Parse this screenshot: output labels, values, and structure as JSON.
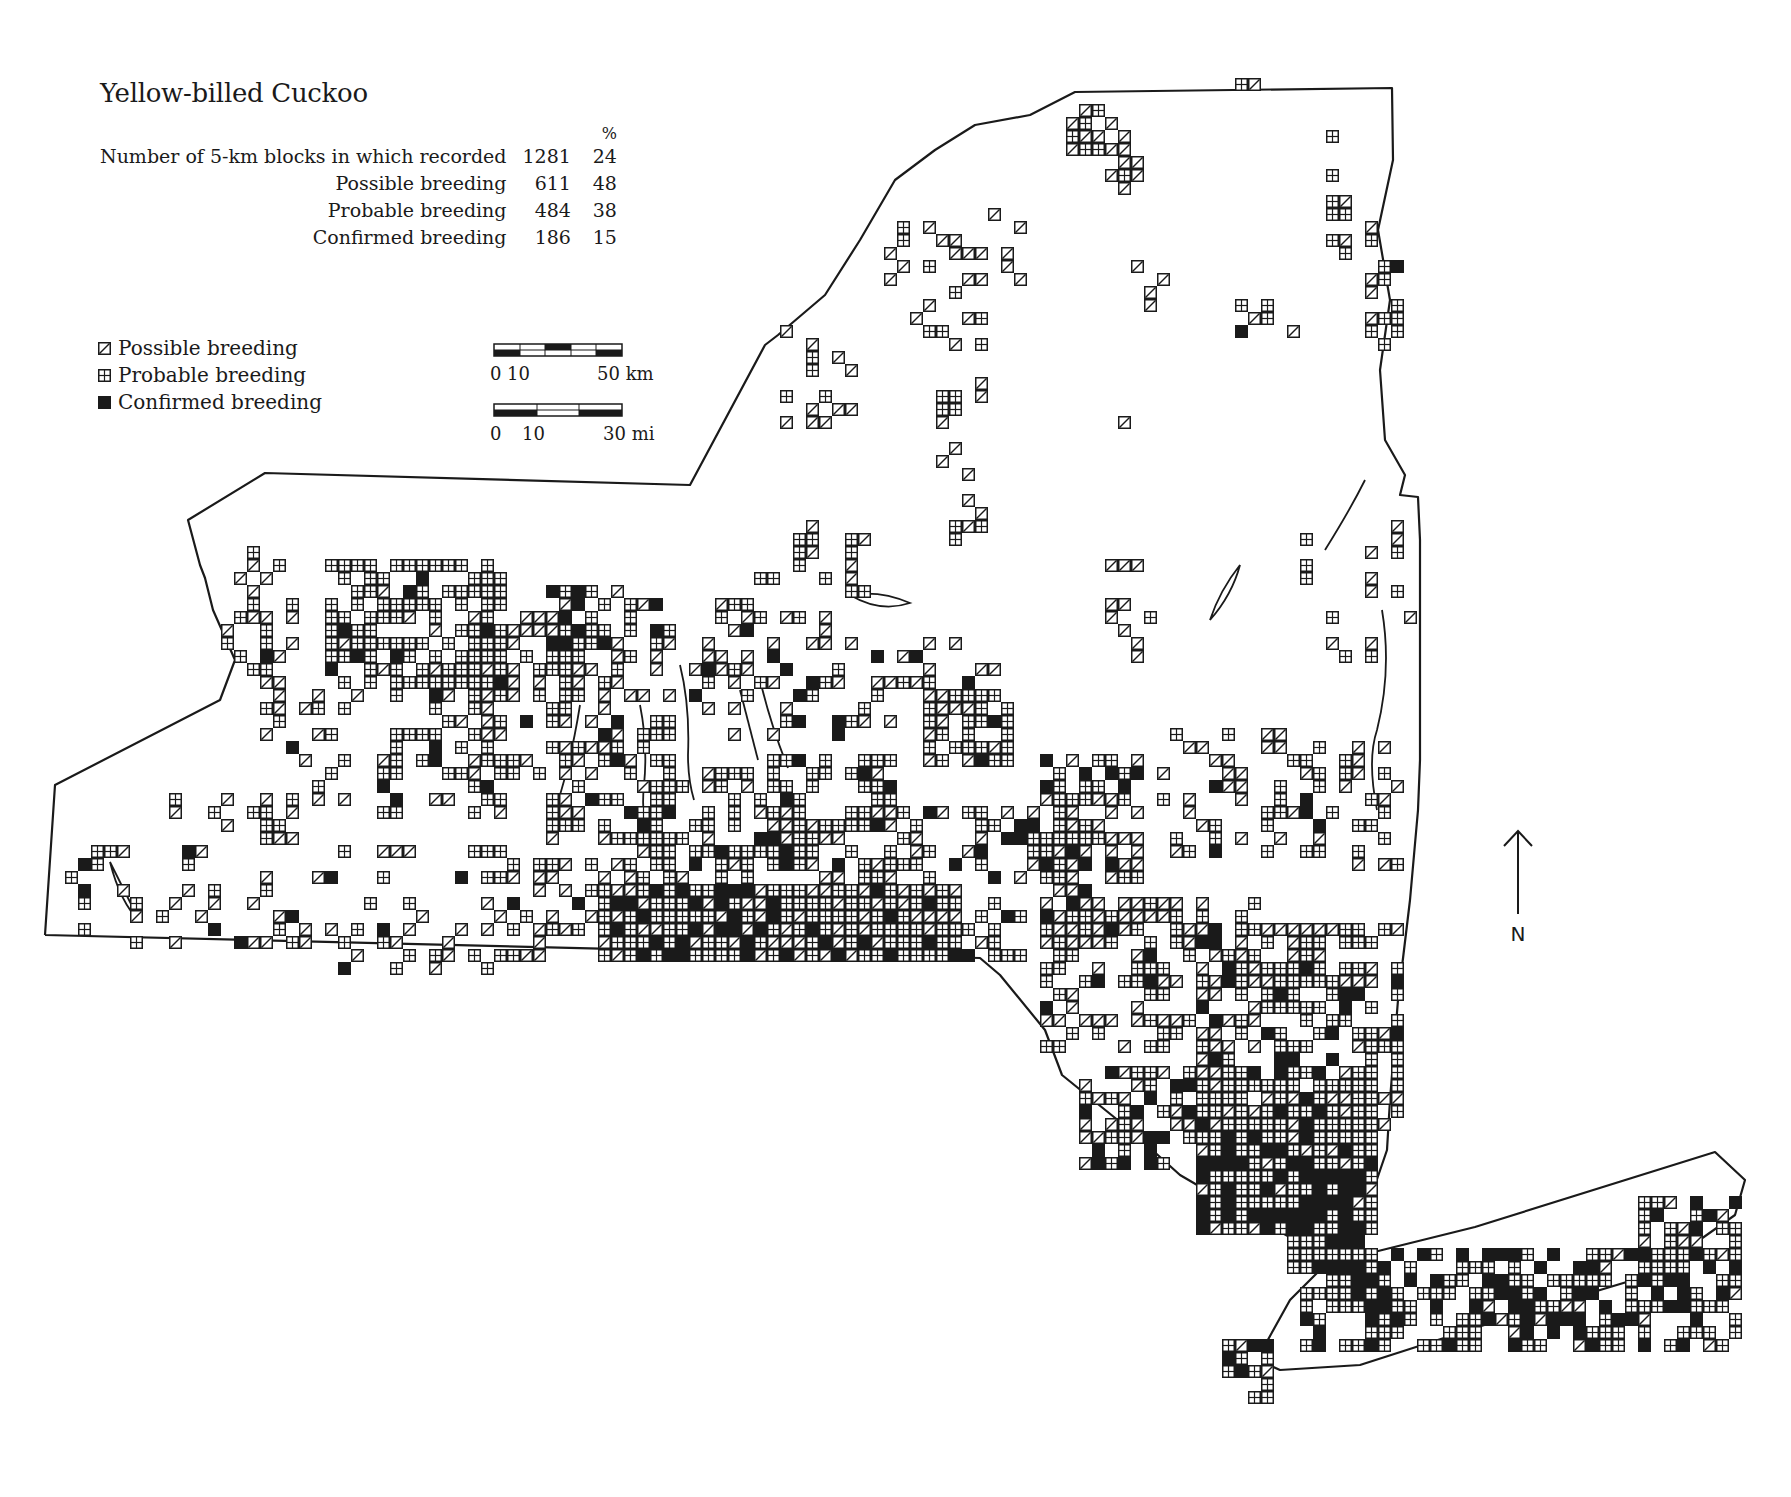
{
  "title": "Yellow-billed Cuckoo",
  "stats": {
    "pct_header": "%",
    "rows": [
      {
        "label": "Number of 5-km blocks in which recorded",
        "count": "1281",
        "pct": "24"
      },
      {
        "label": "Possible breeding",
        "count": "611",
        "pct": "48"
      },
      {
        "label": "Probable breeding",
        "count": "484",
        "pct": "38"
      },
      {
        "label": "Confirmed breeding",
        "count": "186",
        "pct": "15"
      }
    ]
  },
  "legend": {
    "items": [
      {
        "symbol": "possible-icon",
        "label": "Possible breeding"
      },
      {
        "symbol": "probable-icon",
        "label": "Probable breeding"
      },
      {
        "symbol": "confirmed-icon",
        "label": "Confirmed breeding"
      }
    ]
  },
  "scale": {
    "km": {
      "start": "0",
      "mid": "10",
      "end": "50 km"
    },
    "mi": {
      "start": "0",
      "mid": "10",
      "end": "30 mi"
    }
  },
  "north_label": "N",
  "colors": {
    "ink": "#1a1a1a",
    "paper": "#ffffff"
  },
  "map": {
    "block_size": 13,
    "outline": [
      [
        45,
        935
      ],
      [
        55,
        785
      ],
      [
        220,
        700
      ],
      [
        235,
        660
      ],
      [
        213,
        610
      ],
      [
        205,
        578
      ],
      [
        200,
        565
      ],
      [
        188,
        520
      ],
      [
        265,
        473
      ],
      [
        690,
        485
      ],
      [
        765,
        345
      ],
      [
        778,
        335
      ],
      [
        825,
        295
      ],
      [
        860,
        240
      ],
      [
        895,
        180
      ],
      [
        935,
        150
      ],
      [
        975,
        125
      ],
      [
        1030,
        115
      ],
      [
        1075,
        92
      ],
      [
        1392,
        88
      ],
      [
        1393,
        160
      ],
      [
        1378,
        230
      ],
      [
        1390,
        300
      ],
      [
        1380,
        370
      ],
      [
        1385,
        440
      ],
      [
        1405,
        475
      ],
      [
        1400,
        495
      ],
      [
        1418,
        497
      ],
      [
        1420,
        540
      ],
      [
        1420,
        760
      ],
      [
        1418,
        810
      ],
      [
        1410,
        900
      ],
      [
        1398,
        1000
      ],
      [
        1390,
        1100
      ],
      [
        1387,
        1150
      ],
      [
        1350,
        1258
      ],
      [
        1475,
        1227
      ],
      [
        1715,
        1152
      ],
      [
        1745,
        1180
      ],
      [
        1735,
        1215
      ],
      [
        1650,
        1275
      ],
      [
        1500,
        1320
      ],
      [
        1360,
        1365
      ],
      [
        1280,
        1370
      ],
      [
        1262,
        1362
      ],
      [
        1265,
        1345
      ],
      [
        1290,
        1300
      ],
      [
        1340,
        1250
      ],
      [
        1295,
        1240
      ],
      [
        1240,
        1210
      ],
      [
        1180,
        1175
      ],
      [
        1130,
        1130
      ],
      [
        1062,
        1075
      ],
      [
        1045,
        1030
      ],
      [
        1000,
        975
      ],
      [
        980,
        958
      ],
      [
        45,
        935
      ]
    ],
    "clusters": [
      {
        "x": 1070,
        "y": 100,
        "w": 5,
        "h": 4,
        "n": 14,
        "p": 0.62,
        "c": 0.0
      },
      {
        "x": 1100,
        "y": 140,
        "w": 3,
        "h": 4,
        "n": 6,
        "p": 0.85,
        "c": 0.0
      },
      {
        "x": 1230,
        "y": 82,
        "w": 2,
        "h": 1,
        "n": 2,
        "p": 0.8,
        "c": 0.0
      },
      {
        "x": 1320,
        "y": 125,
        "w": 2,
        "h": 10,
        "n": 9,
        "p": 0.3,
        "c": 0.0
      },
      {
        "x": 1360,
        "y": 220,
        "w": 3,
        "h": 10,
        "n": 14,
        "p": 0.4,
        "c": 0.05
      },
      {
        "x": 1240,
        "y": 290,
        "w": 5,
        "h": 4,
        "n": 6,
        "p": 0.6,
        "c": 0.3
      },
      {
        "x": 880,
        "y": 220,
        "w": 8,
        "h": 10,
        "n": 22,
        "p": 0.72,
        "c": 0.0
      },
      {
        "x": 980,
        "y": 210,
        "w": 5,
        "h": 6,
        "n": 6,
        "p": 0.9,
        "c": 0.0
      },
      {
        "x": 1130,
        "y": 260,
        "w": 3,
        "h": 4,
        "n": 4,
        "p": 1.0,
        "c": 0.0
      },
      {
        "x": 780,
        "y": 330,
        "w": 6,
        "h": 8,
        "n": 14,
        "p": 0.65,
        "c": 0.0
      },
      {
        "x": 930,
        "y": 380,
        "w": 4,
        "h": 14,
        "n": 16,
        "p": 0.8,
        "c": 0.0
      },
      {
        "x": 1110,
        "y": 420,
        "w": 2,
        "h": 2,
        "n": 1,
        "p": 1.0,
        "c": 0.0
      },
      {
        "x": 760,
        "y": 520,
        "w": 9,
        "h": 6,
        "n": 16,
        "p": 0.5,
        "c": 0.05
      },
      {
        "x": 1100,
        "y": 560,
        "w": 4,
        "h": 8,
        "n": 10,
        "p": 0.9,
        "c": 0.0
      },
      {
        "x": 1300,
        "y": 520,
        "w": 9,
        "h": 12,
        "n": 16,
        "p": 0.55,
        "c": 0.05
      },
      {
        "x": 230,
        "y": 545,
        "w": 5,
        "h": 6,
        "n": 10,
        "p": 0.6,
        "c": 0.0
      },
      {
        "x": 330,
        "y": 555,
        "w": 14,
        "h": 10,
        "n": 95,
        "p": 0.1,
        "c": 0.05
      },
      {
        "x": 520,
        "y": 580,
        "w": 9,
        "h": 7,
        "n": 34,
        "p": 0.35,
        "c": 0.12
      },
      {
        "x": 215,
        "y": 600,
        "w": 4,
        "h": 6,
        "n": 9,
        "p": 0.5,
        "c": 0.12
      },
      {
        "x": 260,
        "y": 640,
        "w": 8,
        "h": 14,
        "n": 26,
        "p": 0.55,
        "c": 0.05
      },
      {
        "x": 380,
        "y": 660,
        "w": 10,
        "h": 12,
        "n": 44,
        "p": 0.35,
        "c": 0.15
      },
      {
        "x": 460,
        "y": 620,
        "w": 12,
        "h": 12,
        "n": 46,
        "p": 0.45,
        "c": 0.05
      },
      {
        "x": 600,
        "y": 600,
        "w": 12,
        "h": 8,
        "n": 28,
        "p": 0.6,
        "c": 0.2
      },
      {
        "x": 690,
        "y": 610,
        "w": 12,
        "h": 10,
        "n": 34,
        "p": 0.5,
        "c": 0.22
      },
      {
        "x": 850,
        "y": 640,
        "w": 12,
        "h": 8,
        "n": 26,
        "p": 0.55,
        "c": 0.15
      },
      {
        "x": 920,
        "y": 690,
        "w": 7,
        "h": 6,
        "n": 28,
        "p": 0.15,
        "c": 0.05
      },
      {
        "x": 540,
        "y": 720,
        "w": 10,
        "h": 10,
        "n": 48,
        "p": 0.25,
        "c": 0.1
      },
      {
        "x": 640,
        "y": 760,
        "w": 20,
        "h": 16,
        "n": 170,
        "p": 0.28,
        "c": 0.18
      },
      {
        "x": 860,
        "y": 800,
        "w": 18,
        "h": 12,
        "n": 90,
        "p": 0.45,
        "c": 0.12
      },
      {
        "x": 1040,
        "y": 760,
        "w": 8,
        "h": 14,
        "n": 56,
        "p": 0.5,
        "c": 0.15
      },
      {
        "x": 1160,
        "y": 730,
        "w": 10,
        "h": 10,
        "n": 34,
        "p": 0.55,
        "c": 0.12
      },
      {
        "x": 1280,
        "y": 740,
        "w": 10,
        "h": 10,
        "n": 34,
        "p": 0.4,
        "c": 0.1
      },
      {
        "x": 60,
        "y": 840,
        "w": 10,
        "h": 8,
        "n": 18,
        "p": 0.55,
        "c": 0.1
      },
      {
        "x": 170,
        "y": 790,
        "w": 12,
        "h": 12,
        "n": 32,
        "p": 0.6,
        "c": 0.05
      },
      {
        "x": 320,
        "y": 840,
        "w": 14,
        "h": 10,
        "n": 34,
        "p": 0.6,
        "c": 0.05
      },
      {
        "x": 480,
        "y": 860,
        "w": 12,
        "h": 8,
        "n": 40,
        "p": 0.5,
        "c": 0.1
      },
      {
        "x": 600,
        "y": 880,
        "w": 12,
        "h": 6,
        "n": 50,
        "p": 0.25,
        "c": 0.3
      },
      {
        "x": 760,
        "y": 880,
        "w": 16,
        "h": 6,
        "n": 60,
        "p": 0.4,
        "c": 0.12
      },
      {
        "x": 1040,
        "y": 900,
        "w": 20,
        "h": 12,
        "n": 100,
        "p": 0.5,
        "c": 0.12
      },
      {
        "x": 1200,
        "y": 920,
        "w": 16,
        "h": 16,
        "n": 130,
        "p": 0.3,
        "c": 0.18
      },
      {
        "x": 1080,
        "y": 1060,
        "w": 22,
        "h": 8,
        "n": 90,
        "p": 0.3,
        "c": 0.3
      },
      {
        "x": 1200,
        "y": 1100,
        "w": 14,
        "h": 10,
        "n": 100,
        "p": 0.15,
        "c": 0.4
      },
      {
        "x": 1290,
        "y": 1200,
        "w": 6,
        "h": 6,
        "n": 22,
        "p": 0.15,
        "c": 0.3
      },
      {
        "x": 1300,
        "y": 1250,
        "w": 34,
        "h": 8,
        "n": 180,
        "p": 0.12,
        "c": 0.4
      },
      {
        "x": 1640,
        "y": 1190,
        "w": 8,
        "h": 5,
        "n": 22,
        "p": 0.35,
        "c": 0.15
      },
      {
        "x": 1220,
        "y": 1345,
        "w": 4,
        "h": 6,
        "n": 14,
        "p": 0.1,
        "c": 0.5
      }
    ]
  }
}
